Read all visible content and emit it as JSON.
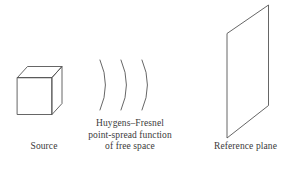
{
  "figure": {
    "background_color": "#ffffff",
    "line_color": "#555555",
    "text_color": "#3a3a3a",
    "width": 293,
    "height": 173
  },
  "source": {
    "label": "Source",
    "shape_name": "cube"
  },
  "wavefronts": {
    "arc_count": 3,
    "shape_name": "wave-arcs"
  },
  "psf": {
    "line1": "Huygens–Fresnel",
    "line2": "point-spread function",
    "line3": "of free space"
  },
  "reference_plane": {
    "label": "Reference plane",
    "shape_name": "parallelogram"
  }
}
